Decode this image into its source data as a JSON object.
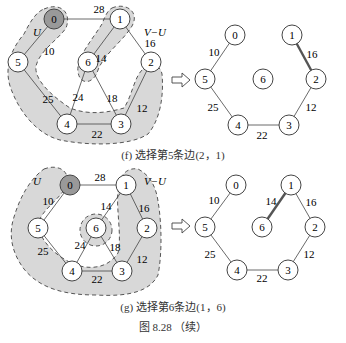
{
  "figure": {
    "title": "图 8.28 （续）",
    "panels": [
      {
        "id": "f",
        "caption": "(f) 选择第5条边(2，1)",
        "set_labels": {
          "u": "U",
          "v_minus_u": "V−U"
        },
        "left_nodes": [
          {
            "id": "0",
            "x": 54,
            "y": 19,
            "filled": true
          },
          {
            "id": "1",
            "x": 120,
            "y": 19
          },
          {
            "id": "5",
            "x": 18,
            "y": 62
          },
          {
            "id": "6",
            "x": 88,
            "y": 62
          },
          {
            "id": "2",
            "x": 151,
            "y": 62
          },
          {
            "id": "4",
            "x": 67,
            "y": 124
          },
          {
            "id": "3",
            "x": 121,
            "y": 124
          }
        ],
        "left_edges": [
          {
            "from": "0",
            "to": "1",
            "w": "28",
            "lx": 95,
            "ly": 12
          },
          {
            "from": "0",
            "to": "5",
            "w": "10",
            "lx": 42,
            "ly": 40
          },
          {
            "from": "1",
            "to": "6",
            "w": "14",
            "lx": 100,
            "ly": 46
          },
          {
            "from": "1",
            "to": "2",
            "w": "16",
            "lx": 143,
            "ly": 40
          },
          {
            "from": "5",
            "to": "4",
            "w": "25",
            "lx": 28,
            "ly": 102
          },
          {
            "from": "6",
            "to": "4",
            "w": "24",
            "lx": 80,
            "ly": 97
          },
          {
            "from": "6",
            "to": "3",
            "w": "18",
            "lx": 109,
            "ly": 101
          },
          {
            "from": "2",
            "to": "3",
            "w": "12",
            "lx": 141,
            "ly": 105
          },
          {
            "from": "4",
            "to": "3",
            "w": "22",
            "lx": 94,
            "ly": 136
          }
        ],
        "right_nodes": [
          {
            "id": "0",
            "x": 235,
            "y": 35
          },
          {
            "id": "1",
            "x": 292,
            "y": 35
          },
          {
            "id": "5",
            "x": 205,
            "y": 79
          },
          {
            "id": "6",
            "x": 263,
            "y": 79
          },
          {
            "id": "2",
            "x": 316,
            "y": 79
          },
          {
            "id": "4",
            "x": 238,
            "y": 125
          },
          {
            "id": "3",
            "x": 289,
            "y": 125
          }
        ],
        "right_edges": [
          {
            "from": "0",
            "to": "5",
            "w": "10",
            "lx": 213,
            "ly": 58
          },
          {
            "from": "5",
            "to": "4",
            "w": "25",
            "lx": 210,
            "ly": 112
          },
          {
            "from": "4",
            "to": "3",
            "w": "22",
            "lx": 261,
            "ly": 137
          },
          {
            "from": "3",
            "to": "2",
            "w": "12",
            "lx": 309,
            "ly": 111
          },
          {
            "from": "1",
            "to": "2",
            "w": "16",
            "lx": 312,
            "ly": 56,
            "highlight": true
          }
        ]
      },
      {
        "id": "g",
        "caption": "(g) 选择第6条边(1，6)",
        "set_labels": {
          "u": "U",
          "v_minus_u": "V−U"
        },
        "highlight_edge": "1-6"
      }
    ]
  },
  "icons": {
    "arrow": "double-arrow-right-icon"
  }
}
